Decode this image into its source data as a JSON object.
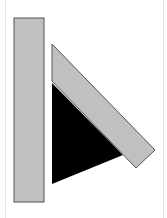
{
  "diagram": {
    "background": "#ffffff",
    "frame_line_color": "#e4e4e4",
    "shapes": {
      "vertical_bar": {
        "fill": "#c0c0c0",
        "stroke": "#555555",
        "x": 14,
        "y": 18,
        "width": 30,
        "height": 184
      },
      "black_triangle": {
        "fill": "#000000",
        "points": "52,83 123,155 52,184"
      },
      "slanted_bar": {
        "fill": "#c0c0c0",
        "stroke": "#555555",
        "points": "52,44 155,150 136,168 52,81"
      }
    }
  }
}
